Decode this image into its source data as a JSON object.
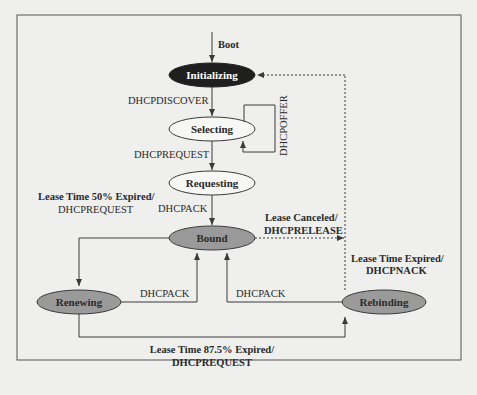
{
  "diagram": {
    "colors": {
      "background": "#efefed",
      "frame": "#555555",
      "line": "#3a3a3a",
      "initial_state_fill": "#1f1f1f",
      "initial_state_text": "#ffffff",
      "plain_state_fill": "#f7f7f5",
      "lease_state_fill": "#9a9a9a",
      "text": "#2a2a2a"
    },
    "entry": {
      "label": "Boot"
    },
    "states": {
      "initializing": "Initializing",
      "selecting": "Selecting",
      "requesting": "Requesting",
      "bound": "Bound",
      "renewing": "Renewing",
      "rebinding": "Rebinding"
    },
    "transitions": {
      "init_to_selecting": "DHCPDISCOVER",
      "selecting_self": "DHCPOFFER",
      "selecting_to_requesting": "DHCPREQUEST",
      "requesting_to_bound": "DHCPACK",
      "bound_to_renewing_line1": "Lease Time 50% Expired/",
      "bound_to_renewing_line2": "DHCPREQUEST",
      "bound_to_init_line1": "Lease Canceled/",
      "bound_to_init_line2": "DHCPRELEASE",
      "rebinding_to_init_line1": "Lease Time Expired/",
      "rebinding_to_init_line2": "DHCPNACK",
      "renewing_to_bound": "DHCPACK",
      "rebinding_to_bound": "DHCPACK",
      "renewing_to_rebinding_line1": "Lease Time 87.5% Expired/",
      "renewing_to_rebinding_line2": "DHCPREQUEST"
    }
  }
}
